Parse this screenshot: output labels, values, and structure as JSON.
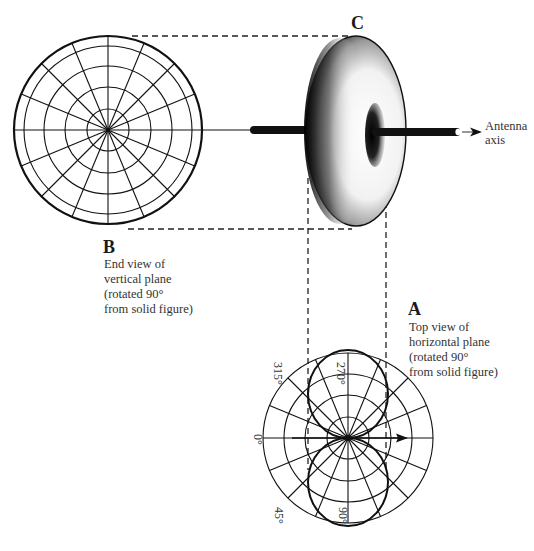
{
  "figure": {
    "views": {
      "B": {
        "letter": "B",
        "caption": [
          "End view of",
          "vertical plane",
          "(rotated 90°",
          "from solid figure)"
        ]
      },
      "C": {
        "letter": "C"
      },
      "A": {
        "letter": "A",
        "caption": [
          "Top view of",
          "horizontal plane",
          "(rotated 90°",
          "from solid figure)"
        ],
        "angle_labels": [
          "315°",
          "270°",
          "0°",
          "45°",
          "90°"
        ]
      }
    },
    "antenna_axis_label": [
      "Antenna",
      "axis"
    ],
    "colors": {
      "line": "#111111",
      "dash": "#222222",
      "text": "#333333",
      "background": "#ffffff"
    }
  }
}
